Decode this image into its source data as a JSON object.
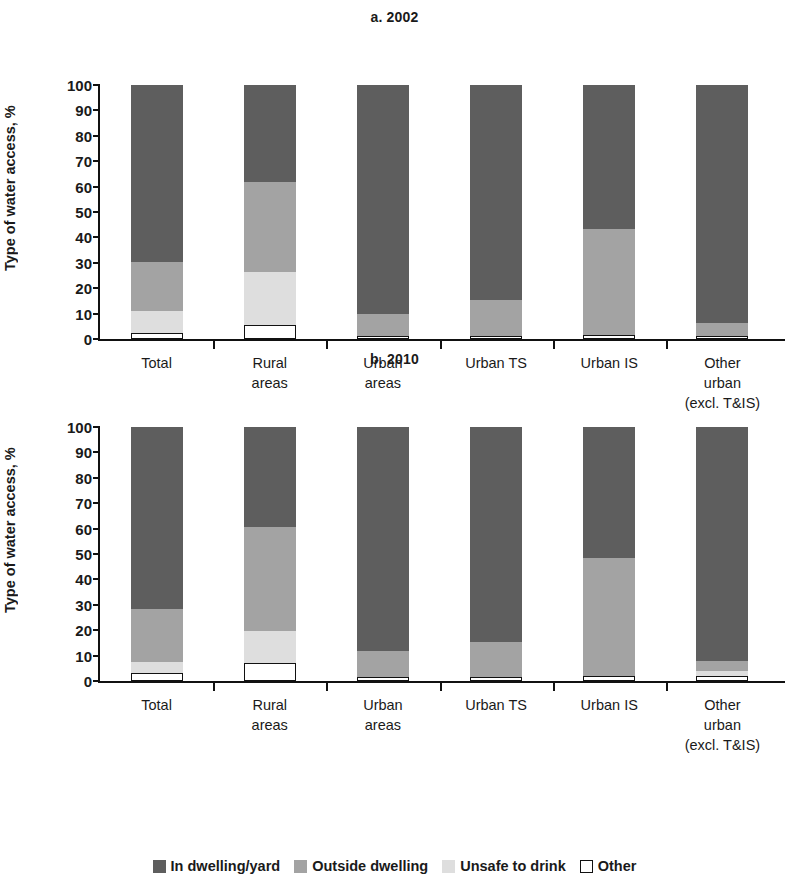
{
  "ylabel": "Type of water access, %",
  "yticks": [
    0,
    10,
    20,
    30,
    40,
    50,
    60,
    70,
    80,
    90,
    100
  ],
  "categories": [
    "Total",
    "Rural\nareas",
    "Urban\nareas",
    "Urban TS",
    "Urban IS",
    "Other\nurban\n(excl. T&IS)"
  ],
  "legend": [
    {
      "label": "In dwelling/yard",
      "color": "#5e5e5e",
      "key": "in_dwelling"
    },
    {
      "label": "Outside dwelling",
      "color": "#a3a3a3",
      "key": "outside_dwelling"
    },
    {
      "label": "Unsafe to drink",
      "color": "#dedede",
      "key": "unsafe"
    },
    {
      "label": "Other",
      "color": "#ffffff",
      "key": "other"
    }
  ],
  "panel_a": {
    "title": "a. 2002"
  },
  "panel_b": {
    "title": "b. 2010"
  },
  "chart_data": [
    {
      "type": "bar",
      "stacked": true,
      "title": "a. 2002",
      "xlabel": "",
      "ylabel": "Type of water access, %",
      "ylim": [
        0,
        100
      ],
      "ytick_step": 10,
      "grid": false,
      "legend_position": "bottom",
      "categories": [
        "Total",
        "Rural areas",
        "Urban areas",
        "Urban TS",
        "Urban IS",
        "Other urban (excl. T&IS)"
      ],
      "series": [
        {
          "name": "Other",
          "color": "#ffffff",
          "values": [
            2.5,
            5.5,
            1.0,
            1.0,
            1.5,
            1.0
          ]
        },
        {
          "name": "Unsafe to drink",
          "color": "#dedede",
          "values": [
            8.5,
            21.0,
            0.0,
            0.0,
            0.0,
            0.0
          ]
        },
        {
          "name": "Outside dwelling",
          "color": "#a3a3a3",
          "values": [
            19.5,
            35.5,
            9.0,
            14.5,
            42.0,
            5.5
          ]
        },
        {
          "name": "In dwelling/yard",
          "color": "#5e5e5e",
          "values": [
            69.5,
            38.0,
            90.0,
            84.5,
            56.5,
            93.5
          ]
        }
      ],
      "cumulative_tops": {
        "Total": {
          "other": 2.5,
          "unsafe": 11.0,
          "outside": 30.5,
          "in_dwelling": 100
        },
        "Rural areas": {
          "other": 5.5,
          "unsafe": 26.5,
          "outside": 62.0,
          "in_dwelling": 100
        },
        "Urban areas": {
          "other": 1.0,
          "unsafe": 1.0,
          "outside": 10.0,
          "in_dwelling": 100
        },
        "Urban TS": {
          "other": 1.0,
          "unsafe": 1.0,
          "outside": 15.5,
          "in_dwelling": 100
        },
        "Urban IS": {
          "other": 1.5,
          "unsafe": 1.5,
          "outside": 43.5,
          "in_dwelling": 100
        },
        "Other urban (excl. T&IS)": {
          "other": 1.0,
          "unsafe": 1.0,
          "outside": 6.5,
          "in_dwelling": 100
        }
      }
    },
    {
      "type": "bar",
      "stacked": true,
      "title": "b. 2010",
      "xlabel": "",
      "ylabel": "Type of water access, %",
      "ylim": [
        0,
        100
      ],
      "ytick_step": 10,
      "grid": false,
      "legend_position": "bottom",
      "categories": [
        "Total",
        "Rural areas",
        "Urban areas",
        "Urban TS",
        "Urban IS",
        "Other urban (excl. T&IS)"
      ],
      "series": [
        {
          "name": "Other",
          "color": "#ffffff",
          "values": [
            3.0,
            7.0,
            1.5,
            1.5,
            2.0,
            2.0
          ]
        },
        {
          "name": "Unsafe to drink",
          "color": "#dedede",
          "values": [
            4.5,
            12.5,
            0.0,
            0.0,
            0.0,
            2.0
          ]
        },
        {
          "name": "Outside dwelling",
          "color": "#a3a3a3",
          "values": [
            21.0,
            41.0,
            10.5,
            14.0,
            46.5,
            4.0
          ]
        },
        {
          "name": "In dwelling/yard",
          "color": "#5e5e5e",
          "values": [
            71.5,
            39.5,
            88.0,
            84.5,
            51.5,
            92.0
          ]
        }
      ],
      "cumulative_tops": {
        "Total": {
          "other": 3.0,
          "unsafe": 7.5,
          "outside": 28.5,
          "in_dwelling": 100
        },
        "Rural areas": {
          "other": 7.0,
          "unsafe": 19.5,
          "outside": 60.5,
          "in_dwelling": 100
        },
        "Urban areas": {
          "other": 1.5,
          "unsafe": 1.5,
          "outside": 12.0,
          "in_dwelling": 100
        },
        "Urban TS": {
          "other": 1.5,
          "unsafe": 1.5,
          "outside": 15.5,
          "in_dwelling": 100
        },
        "Urban IS": {
          "other": 2.0,
          "unsafe": 2.0,
          "outside": 48.5,
          "in_dwelling": 100
        },
        "Other urban (excl. T&IS)": {
          "other": 2.0,
          "unsafe": 4.0,
          "outside": 8.0,
          "in_dwelling": 100
        }
      }
    }
  ]
}
